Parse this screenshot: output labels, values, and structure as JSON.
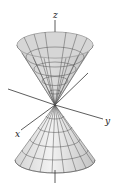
{
  "figure": {
    "axes": {
      "x_label": "x",
      "y_label": "y",
      "z_label": "z"
    },
    "colors": {
      "surface_light": "#e8e8e8",
      "surface_dark": "#bdbdbd",
      "mesh": "#555555",
      "axis": "#333333"
    }
  }
}
